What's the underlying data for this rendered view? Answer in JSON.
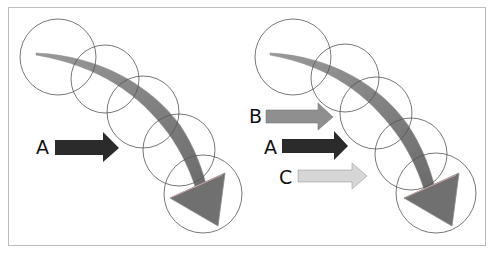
{
  "diagram": {
    "left_panel": {
      "arrows": [
        {
          "label": "A",
          "color": "#2b2b2b"
        }
      ]
    },
    "right_panel": {
      "arrows": [
        {
          "label": "B",
          "color": "#8f8f8f"
        },
        {
          "label": "A",
          "color": "#2b2b2b"
        },
        {
          "label": "C",
          "color": "#d6d6d6"
        }
      ]
    },
    "circle_count_per_panel": 5,
    "curved_arrow_color": "#6e6e6e"
  }
}
